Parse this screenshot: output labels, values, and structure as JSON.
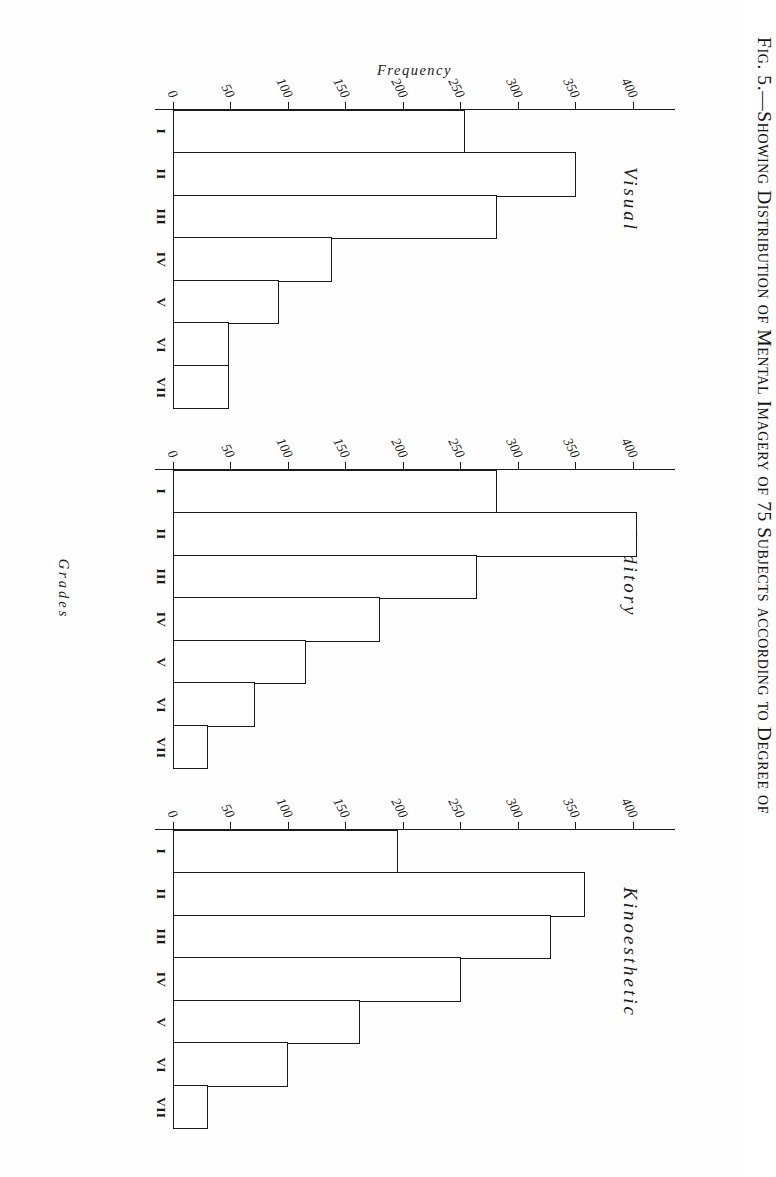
{
  "figure": {
    "caption": "Fig. 5.—Showing Distribution of Mental Imagery of 75 Subjects according to Degree of",
    "y_axis_label": "Frequency",
    "x_axis_label": "Grades"
  },
  "chart_data": {
    "type": "bar",
    "title": "Fig. 5.—Showing Distribution of Mental Imagery of 75 Subjects according to Degree of",
    "xlabel": "Grades",
    "ylabel": "Frequency",
    "ylim": [
      0,
      400
    ],
    "yticks": [
      400,
      350,
      300,
      250,
      200,
      150,
      100,
      50,
      0
    ],
    "grid": false,
    "legend": "none",
    "categories": [
      "I",
      "II",
      "III",
      "IV",
      "V",
      "VI",
      "VII"
    ],
    "panels": [
      {
        "name": "Visual",
        "values": [
          243,
          336,
          270,
          132,
          88,
          46,
          46
        ]
      },
      {
        "name": "Auditory",
        "values": [
          270,
          387,
          253,
          172,
          110,
          68,
          28
        ]
      },
      {
        "name": "Kinoesthetic",
        "values": [
          187,
          343,
          315,
          240,
          155,
          95,
          28
        ]
      }
    ],
    "series": [
      {
        "name": "Visual",
        "values": [
          243,
          336,
          270,
          132,
          88,
          46,
          46
        ]
      },
      {
        "name": "Auditory",
        "values": [
          270,
          387,
          253,
          172,
          110,
          68,
          28
        ]
      },
      {
        "name": "Kinoesthetic",
        "values": [
          187,
          343,
          315,
          240,
          155,
          95,
          28
        ]
      }
    ],
    "colors": {
      "ink": "#1a1a1a",
      "paper": "#fefefe",
      "bar_fill": "#ffffff"
    }
  }
}
